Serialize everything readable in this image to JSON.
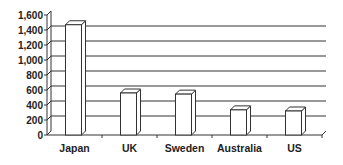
{
  "chart_data": {
    "type": "bar",
    "style": "3d-column",
    "title": "",
    "xlabel": "",
    "ylabel": "",
    "categories": [
      "Japan",
      "UK",
      "Sweden",
      "Australia",
      "US"
    ],
    "values": [
      1470,
      560,
      545,
      335,
      320
    ],
    "ylim": [
      0,
      1600
    ],
    "yticks": [
      0,
      200,
      400,
      600,
      800,
      1000,
      1200,
      1400,
      1600
    ],
    "ytick_labels": [
      "0",
      "200",
      "400",
      "600",
      "800",
      "1,000",
      "1,200",
      "1,400",
      "1,600"
    ],
    "grid": true,
    "legend": null,
    "colors": {
      "bar_fill": "#ffffff",
      "bar_stroke": "#333333",
      "grid": "#333333",
      "text": "#222222"
    }
  }
}
